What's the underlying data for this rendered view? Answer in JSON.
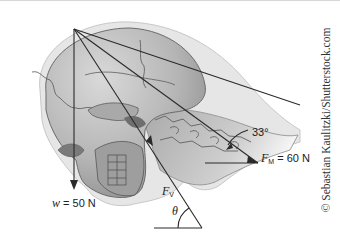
{
  "figure": {
    "labels": {
      "weight": {
        "symbol": "w",
        "value": "= 50 N"
      },
      "vertebra_force": {
        "symbol": "F",
        "subscript": "V"
      },
      "muscle_force": {
        "symbol": "F",
        "subscript": "M",
        "value": "= 60 N"
      },
      "angle_muscle": "33°",
      "angle_theta": "θ"
    },
    "credit": "© Sebastian Kaulitzki/Shutterstock.com",
    "colors": {
      "skull_fill": "#b9b9b9",
      "skin_outline": "#e4e4e4",
      "line": "#2a2a2a",
      "background": "#ffffff"
    }
  }
}
